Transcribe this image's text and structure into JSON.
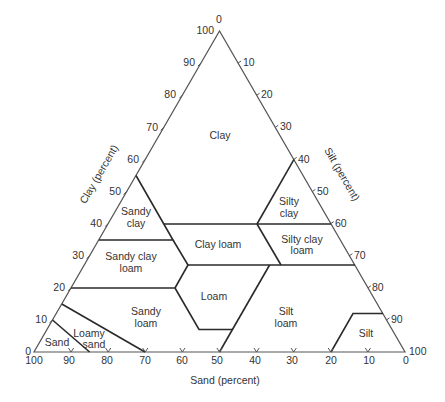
{
  "diagram": {
    "axes": {
      "clay": {
        "label": "Clay (percent)",
        "ticks": [
          "100",
          "90",
          "80",
          "70",
          "60",
          "50",
          "40",
          "30",
          "20",
          "10",
          "0"
        ]
      },
      "silt": {
        "label": "Silt (percent)",
        "ticks": [
          "0",
          "10",
          "20",
          "30",
          "40",
          "50",
          "60",
          "70",
          "80",
          "90",
          "100"
        ]
      },
      "sand": {
        "label": "Sand (percent)",
        "ticks": [
          "100",
          "90",
          "80",
          "70",
          "60",
          "50",
          "40",
          "30",
          "20",
          "10",
          "0"
        ]
      }
    },
    "regions": {
      "clay": [
        "Clay"
      ],
      "silty_clay": [
        "Silty",
        "clay"
      ],
      "sandy_clay": [
        "Sandy",
        "clay"
      ],
      "clay_loam": [
        "Clay loam"
      ],
      "silty_clay_loam": [
        "Silty clay",
        "loam"
      ],
      "sandy_clay_loam": [
        "Sandy clay",
        "loam"
      ],
      "loam": [
        "Loam"
      ],
      "silt_loam": [
        "Silt",
        "loam"
      ],
      "sandy_loam": [
        "Sandy",
        "loam"
      ],
      "silt": [
        "Silt"
      ],
      "loamy_sand": [
        "Loamy",
        "sand"
      ],
      "sand": [
        "Sand"
      ]
    },
    "colors": {
      "outline": "#555555",
      "boundary": "#2a2a2a",
      "text": "#333333",
      "background": "#ffffff"
    }
  }
}
